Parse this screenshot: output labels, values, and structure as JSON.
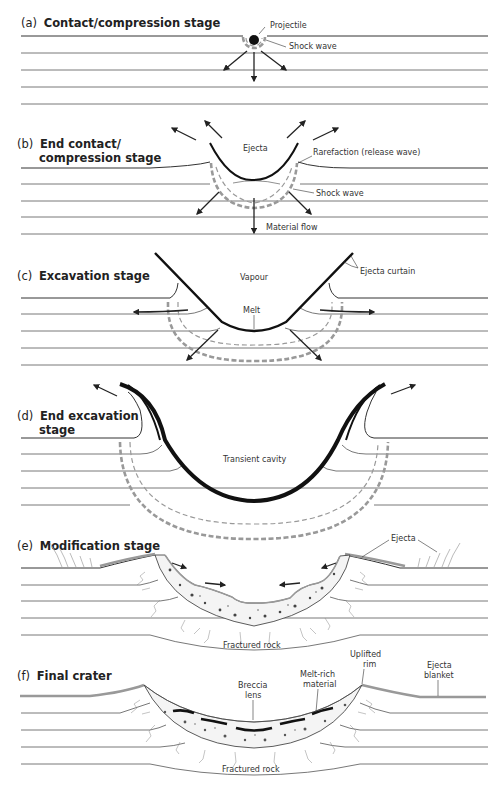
{
  "figure": {
    "panels": [
      {
        "id": "a",
        "letter": "(a)",
        "title": "Contact/compression stage",
        "labels": {
          "projectile": "Projectile",
          "shock_wave": "Shock wave"
        }
      },
      {
        "id": "b",
        "letter": "(b)",
        "title_line1": "End contact/",
        "title_line2": "compression stage",
        "labels": {
          "ejecta": "Ejecta",
          "rarefaction": "Rarefaction (release wave)",
          "shock_wave": "Shock wave",
          "material_flow": "Material flow"
        }
      },
      {
        "id": "c",
        "letter": "(c)",
        "title": "Excavation stage",
        "labels": {
          "vapour": "Vapour",
          "ejecta_curtain": "Ejecta curtain",
          "melt": "Melt"
        }
      },
      {
        "id": "d",
        "letter": "(d)",
        "title_line1": "End excavation",
        "title_line2": "stage",
        "labels": {
          "transient_cavity": "Transient cavity"
        }
      },
      {
        "id": "e",
        "letter": "(e)",
        "title": "Modification stage",
        "labels": {
          "ejecta": "Ejecta",
          "fractured_rock": "Fractured rock"
        }
      },
      {
        "id": "f",
        "letter": "(f)",
        "title": "Final crater",
        "labels": {
          "uplifted_rim_1": "Uplifted",
          "uplifted_rim_2": "rim",
          "ejecta_blanket_1": "Ejecta",
          "ejecta_blanket_2": "blanket",
          "melt_rich_1": "Melt-rich",
          "melt_rich_2": "material",
          "breccia_1": "Breccia",
          "breccia_2": "lens",
          "fractured_rock": "Fractured rock"
        }
      }
    ]
  },
  "colors": {
    "crater_line": "#111111",
    "shock_wave": "#999999",
    "ejecta_gray": "#999999",
    "layer_line": "#555555"
  }
}
